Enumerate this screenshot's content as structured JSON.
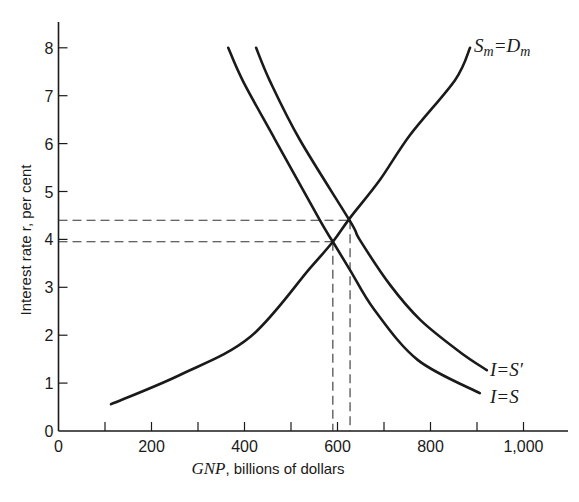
{
  "chart_data": {
    "type": "line",
    "title": "",
    "xlabel": "GNP, billions of dollars",
    "xlabel_italic_part": "GNP",
    "xlabel_rest": ", billions of dollars",
    "ylabel": "Interest rate r, per cent",
    "xlim": [
      0,
      1100
    ],
    "ylim": [
      0,
      8.6
    ],
    "x_ticks": [
      0,
      100,
      200,
      300,
      400,
      500,
      600,
      700,
      800,
      900,
      1000
    ],
    "x_tick_labels": [
      {
        "value": 0,
        "label": "0"
      },
      {
        "value": 200,
        "label": "200"
      },
      {
        "value": 400,
        "label": "400"
      },
      {
        "value": 600,
        "label": "600"
      },
      {
        "value": 800,
        "label": "800"
      },
      {
        "value": 1000,
        "label": "1,000"
      }
    ],
    "y_ticks": [
      0,
      1,
      2,
      3,
      4,
      5,
      6,
      7,
      8
    ],
    "y_tick_labels": [
      "0",
      "1",
      "2",
      "3",
      "4",
      "5",
      "6",
      "7",
      "8"
    ],
    "grid": false,
    "legend": "none (curves labeled directly)",
    "series": [
      {
        "name": "I=S",
        "label_main": "I=S",
        "x": [
          365,
          397,
          466,
          562,
          590,
          627,
          680,
          773,
          906
        ],
        "y": [
          8.0,
          7.3,
          6.08,
          4.4,
          3.95,
          3.36,
          2.52,
          1.48,
          0.79
        ]
      },
      {
        "name": "I=S'",
        "label_main": "I=S′",
        "x": [
          425,
          455,
          519,
          627,
          648,
          713,
          778,
          863,
          921
        ],
        "y": [
          8.0,
          7.3,
          6.08,
          4.38,
          3.99,
          3.05,
          2.32,
          1.65,
          1.27
        ]
      },
      {
        "name": "Sm=Dm",
        "label_S": "S",
        "label_eq": "=",
        "label_D": "D",
        "label_sub": "m",
        "x": [
          113,
          261,
          412,
          541,
          590,
          627,
          691,
          756,
          853,
          885
        ],
        "y": [
          0.56,
          1.17,
          1.96,
          3.4,
          3.95,
          4.45,
          5.24,
          6.18,
          7.33,
          8.0
        ]
      }
    ],
    "annotations": [
      {
        "type": "dashed-guide",
        "from": [
          0,
          4.4
        ],
        "to": [
          627,
          4.4
        ],
        "vertical_to_axis": true,
        "description": "equilibrium with I=S'"
      },
      {
        "type": "dashed-guide",
        "from": [
          0,
          3.95
        ],
        "to": [
          590,
          3.95
        ],
        "vertical_to_axis": true,
        "description": "equilibrium with I=S"
      }
    ],
    "equilibria": [
      {
        "curves": [
          "I=S",
          "Sm=Dm"
        ],
        "gnp": 590,
        "r": 3.95
      },
      {
        "curves": [
          "I=S'",
          "Sm=Dm"
        ],
        "gnp": 627,
        "r": 4.4
      }
    ]
  },
  "labels": {
    "y_axis_title": "Interest rate r, per cent",
    "x_axis_title_italic": "GNP",
    "x_axis_title_rest": ", billions of dollars",
    "curve_is": "I=S",
    "curve_is_prime": "I=S′",
    "curve_sm_s": "S",
    "curve_sm_sub1": "m",
    "curve_sm_eq": "=D",
    "curve_sm_sub2": "m"
  },
  "colors": {
    "ink": "#1a1a1a",
    "dashes": "#333333",
    "background": "#ffffff"
  }
}
